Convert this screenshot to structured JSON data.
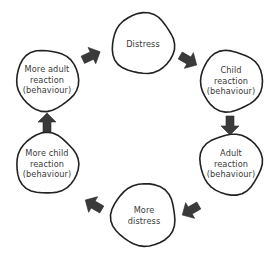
{
  "diagram": {
    "type": "cycle",
    "colors": {
      "background": "#ffffff",
      "circle_stroke": "#222222",
      "arrow_fill": "#3a3a3a",
      "text": "#3a3a3a"
    },
    "nodes": [
      {
        "id": "distress",
        "lines": [
          "Distress"
        ],
        "cx": 143,
        "cy": 44,
        "r": 31
      },
      {
        "id": "child-reaction",
        "lines": [
          "Child",
          "reaction",
          "(behaviour)"
        ],
        "cx": 231,
        "cy": 81,
        "r": 31
      },
      {
        "id": "adult-reaction",
        "lines": [
          "Adult",
          "reaction",
          "(behaviour)"
        ],
        "cx": 231,
        "cy": 164,
        "r": 31
      },
      {
        "id": "more-distress",
        "lines": [
          "More",
          "distress"
        ],
        "cx": 144,
        "cy": 215,
        "r": 32
      },
      {
        "id": "more-child-reaction",
        "lines": [
          "More child",
          "reaction",
          "(behaviour)"
        ],
        "cx": 47,
        "cy": 164,
        "r": 31
      },
      {
        "id": "more-adult-reaction",
        "lines": [
          "More adult",
          "reaction",
          "(behaviour)"
        ],
        "cx": 47,
        "cy": 80,
        "r": 31
      }
    ],
    "edges": [
      {
        "from": "more-adult-reaction",
        "to": "distress",
        "x": 91,
        "y": 56,
        "angle": -25
      },
      {
        "from": "distress",
        "to": "child-reaction",
        "x": 188,
        "y": 60,
        "angle": 30
      },
      {
        "from": "child-reaction",
        "to": "adult-reaction",
        "x": 230,
        "y": 125,
        "angle": 90
      },
      {
        "from": "adult-reaction",
        "to": "more-distress",
        "x": 191,
        "y": 210,
        "angle": 150
      },
      {
        "from": "more-distress",
        "to": "more-child-reaction",
        "x": 94,
        "y": 205,
        "angle": -150
      },
      {
        "from": "more-child-reaction",
        "to": "more-adult-reaction",
        "x": 47,
        "y": 123,
        "angle": -90
      }
    ]
  }
}
